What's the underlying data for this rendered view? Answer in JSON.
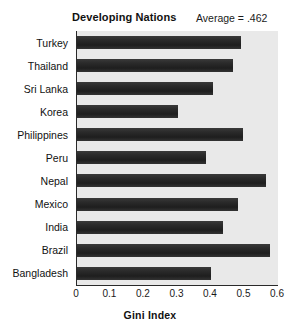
{
  "chart_data": {
    "type": "bar",
    "orientation": "horizontal",
    "title": "Developing Nations",
    "xlabel": "Gini Index",
    "ylabel": "",
    "categories": [
      "Turkey",
      "Thailand",
      "Sri Lanka",
      "Korea",
      "Philippines",
      "Peru",
      "Nepal",
      "Mexico",
      "India",
      "Brazil",
      "Bangladesh"
    ],
    "values": [
      0.49,
      0.466,
      0.406,
      0.3,
      0.495,
      0.385,
      0.565,
      0.48,
      0.435,
      0.575,
      0.4
    ],
    "xlim": [
      0,
      0.6
    ],
    "xticks": [
      "0",
      "0.1",
      "0.2",
      "0.3",
      "0.4",
      "0.5",
      "0.6"
    ],
    "xtick_values": [
      0,
      0.1,
      0.2,
      0.3,
      0.4,
      0.5,
      0.6
    ],
    "grid": false,
    "legend": null,
    "annotations": [
      {
        "name": "average-annotation",
        "text": "Average = .462",
        "value": 0.462
      }
    ],
    "colors": {
      "bar": "#242424",
      "plot_background": "#e9e9e9",
      "figure_background": "#ffffff",
      "axis": "#2a2a2a",
      "text": "#111111"
    }
  },
  "annotation": {
    "average_label": "Average = .462"
  }
}
